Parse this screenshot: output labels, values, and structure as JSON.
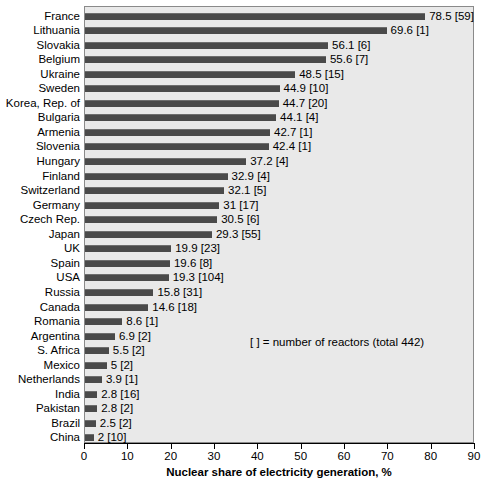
{
  "chart_data": {
    "type": "bar",
    "orientation": "horizontal",
    "title": "",
    "xlabel": "Nuclear share of electricity generation, %",
    "ylabel": "",
    "xlim": [
      0,
      90
    ],
    "xticks": [
      0,
      10,
      20,
      30,
      40,
      50,
      60,
      70,
      80,
      90
    ],
    "grid": false,
    "legend_position": "inside-right",
    "annotation": "[  ] = number of reactors (total 442)",
    "value_label_format": "{value} [{reactors}]",
    "categories": [
      "France",
      "Lithuania",
      "Slovakia",
      "Belgium",
      "Ukraine",
      "Sweden",
      "Korea, Rep. of",
      "Bulgaria",
      "Armenia",
      "Slovenia",
      "Hungary",
      "Finland",
      "Switzerland",
      "Germany",
      "Czech Rep.",
      "Japan",
      "UK",
      "Spain",
      "USA",
      "Russia",
      "Canada",
      "Romania",
      "Argentina",
      "S. Africa",
      "Mexico",
      "Netherlands",
      "India",
      "Pakistan",
      "Brazil",
      "China"
    ],
    "values": [
      78.5,
      69.6,
      56.1,
      55.6,
      48.5,
      44.9,
      44.7,
      44.1,
      42.7,
      42.4,
      37.2,
      32.9,
      32.1,
      31,
      30.5,
      29.3,
      19.9,
      19.6,
      19.3,
      15.8,
      14.6,
      8.6,
      6.9,
      5.5,
      5,
      3.9,
      2.8,
      2.8,
      2.5,
      2
    ],
    "value_texts": [
      "78.5",
      "69.6",
      "56.1",
      "55.6",
      "48.5",
      "44.9",
      "44.7",
      "44.1",
      "42.7",
      "42.4",
      "37.2",
      "32.9",
      "32.1",
      "31",
      "30.5",
      "29.3",
      "19.9",
      "19.6",
      "19.3",
      "15.8",
      "14.6",
      "8.6",
      "6.9",
      "5.5",
      "5",
      "3.9",
      "2.8",
      "2.8",
      "2.5",
      "2"
    ],
    "reactors": [
      59,
      1,
      6,
      7,
      15,
      10,
      20,
      4,
      1,
      1,
      4,
      4,
      5,
      17,
      6,
      55,
      23,
      8,
      104,
      31,
      18,
      1,
      2,
      2,
      2,
      1,
      16,
      2,
      2,
      10
    ],
    "bar_labels": [
      "78.5 [59]",
      "69.6 [1]",
      "56.1 [6]",
      "55.6 [7]",
      "48.5 [15]",
      "44.9 [10]",
      "44.7 [20]",
      "44.1 [4]",
      "42.7 [1]",
      "42.4 [1]",
      "37.2 [4]",
      "32.9 [4]",
      "32.1 [5]",
      "31 [17]",
      "30.5 [6]",
      "29.3 [55]",
      "19.9 [23]",
      "19.6 [8]",
      "19.3 [104]",
      "15.8 [31]",
      "14.6 [18]",
      "8.6 [1]",
      "6.9 [2]",
      "5.5 [2]",
      "5 [2]",
      "3.9 [1]",
      "2.8 [16]",
      "2.8 [2]",
      "2.5 [2]",
      "2 [10]"
    ],
    "colors": {
      "bar": "#4a4a4a",
      "bar_highlight": "#6e6e6e",
      "plot_background": "#e9e9e9",
      "frame": "#8a8a8a",
      "text": "#000000",
      "page_background": "#ffffff"
    }
  }
}
